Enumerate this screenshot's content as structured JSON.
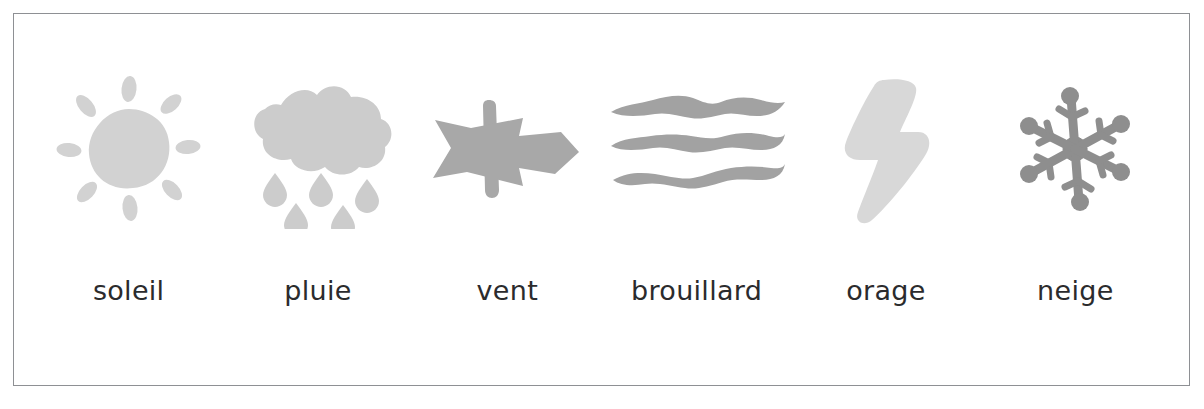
{
  "poster": {
    "title": "Le temps qu'il fait",
    "language": "fr",
    "frame_color": "#8e9094",
    "background_color": "#ffffff",
    "caption_color": "#2b2b2d"
  },
  "items": [
    {
      "label": "soleil",
      "icon": "sun-icon",
      "color": "#d2d2d2"
    },
    {
      "label": "pluie",
      "icon": "rain-cloud-icon",
      "color": "#cccccc"
    },
    {
      "label": "vent",
      "icon": "wind-arrow-icon",
      "color": "#a8a8a8"
    },
    {
      "label": "brouillard",
      "icon": "fog-icon",
      "color": "#a2a2a2"
    },
    {
      "label": "orage",
      "icon": "lightning-bolt-icon",
      "color": "#d8d8d8"
    },
    {
      "label": "neige",
      "icon": "snowflake-icon",
      "color": "#8e8e8e"
    }
  ]
}
